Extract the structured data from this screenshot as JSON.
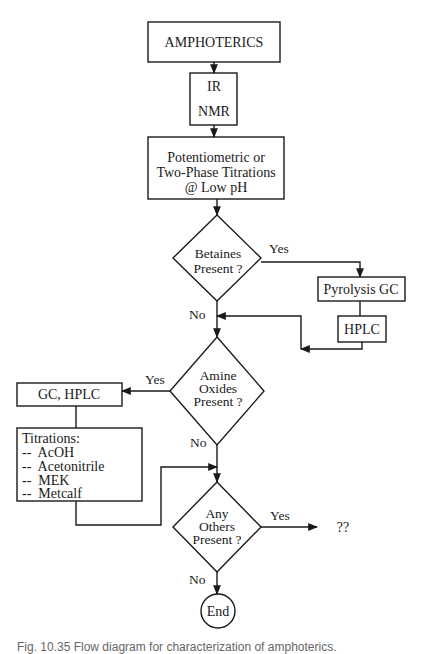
{
  "diagram": {
    "nodes": {
      "start": {
        "label": "AMPHOTERICS"
      },
      "spectroscopy": {
        "line1": "IR",
        "line2": "NMR"
      },
      "titration_low_ph": {
        "line1": "Potentiometric or",
        "line2": "Two-Phase Titrations",
        "line3": "@ Low pH"
      },
      "betaines_decision": {
        "line1": "Betaines",
        "line2": "Present ?"
      },
      "pyrolysis": {
        "label": "Pyrolysis GC"
      },
      "hplc": {
        "label": "HPLC"
      },
      "amine_oxides_decision": {
        "line1": "Amine",
        "line2": "Oxides",
        "line3": "Present ?"
      },
      "gc_hplc": {
        "label": "GC, HPLC"
      },
      "titrations": {
        "title": "Titrations:",
        "items": [
          "--  AcOH",
          "--  Acetonitrile",
          "--  MEK",
          "--  Metcalf"
        ]
      },
      "others_decision": {
        "line1": "Any",
        "line2": "Others",
        "line3": "Present ?"
      },
      "unknown": {
        "label": "??"
      },
      "end": {
        "label": "End"
      }
    },
    "edge_labels": {
      "betaines_yes": "Yes",
      "betaines_no": "No",
      "amine_yes": "Yes",
      "amine_no": "No",
      "others_yes": "Yes",
      "others_no": "No"
    },
    "colors": {
      "stroke": "#1a1a1a",
      "background": "#ffffff"
    }
  },
  "caption": "Fig. 10.35   Flow diagram for characterization of amphoterics."
}
